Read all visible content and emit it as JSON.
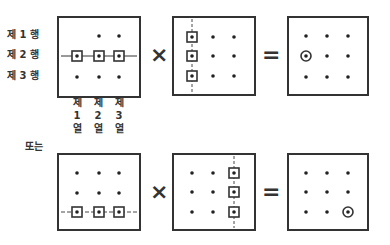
{
  "labels": {
    "rows": [
      "제 1 행",
      "제 2 행",
      "제 3 행"
    ],
    "columns": [
      [
        "제",
        "1",
        "열"
      ],
      [
        "제",
        "2",
        "열"
      ],
      [
        "제",
        "3",
        "열"
      ]
    ],
    "or": "또는"
  },
  "operators": {
    "multiply": "×",
    "equals": "="
  },
  "diagrams": [
    {
      "name": "row-2-times-column-1",
      "left_matrix": {
        "highlight": "row 2",
        "boxed": [
          [
            1,
            0
          ],
          [
            1,
            1
          ],
          [
            1,
            2
          ]
        ],
        "missing_dots": [
          [
            0,
            0
          ]
        ],
        "line": "horizontal solid"
      },
      "right_matrix": {
        "highlight": "column 1",
        "boxed": [
          [
            0,
            0
          ],
          [
            1,
            0
          ],
          [
            2,
            0
          ]
        ],
        "line": "vertical dashed"
      },
      "result_matrix": {
        "circled": [
          1,
          0
        ]
      }
    },
    {
      "name": "row-3-times-column-3",
      "left_matrix": {
        "highlight": "row 3",
        "boxed": [
          [
            2,
            0
          ],
          [
            2,
            1
          ],
          [
            2,
            2
          ]
        ],
        "line": "horizontal dashed"
      },
      "right_matrix": {
        "highlight": "column 3",
        "boxed": [
          [
            0,
            2
          ],
          [
            1,
            2
          ],
          [
            2,
            2
          ]
        ],
        "line": "vertical dashed"
      },
      "result_matrix": {
        "circled": [
          2,
          2
        ]
      }
    }
  ]
}
